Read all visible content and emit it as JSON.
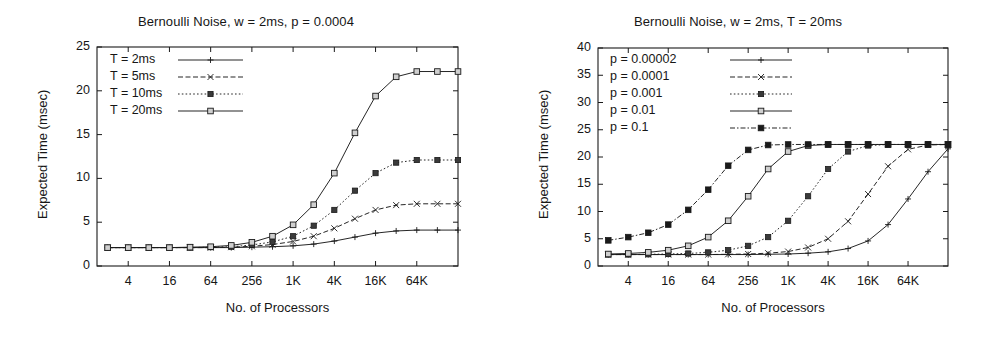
{
  "figure": {
    "panels": [
      {
        "id": "left-panel",
        "title": "Bernoulli Noise, w = 2ms, p = 0.0004",
        "xlabel": "No. of Processors",
        "ylabel": "Expected Time (msec)"
      },
      {
        "id": "right-panel",
        "title": "Bernoulli Noise, w = 2ms, T = 20ms",
        "xlabel": "No. of Processors",
        "ylabel": "Expected Time (msec)"
      }
    ]
  },
  "chart_data": [
    {
      "type": "line",
      "title": "Bernoulli Noise, w = 2ms, p = 0.0004",
      "xlabel": "No. of Processors",
      "ylabel": "Expected Time (msec)",
      "xscale": "log2",
      "x_tick_labels": [
        "4",
        "16",
        "64",
        "256",
        "1K",
        "4K",
        "16K",
        "64K"
      ],
      "x_tick_values": [
        4,
        16,
        64,
        256,
        1024,
        4096,
        16384,
        65536
      ],
      "xlim": [
        1.4,
        262144
      ],
      "ylim": [
        0,
        25
      ],
      "y_tick_labels": [
        "0",
        "5",
        "10",
        "15",
        "20",
        "25"
      ],
      "y_tick_values": [
        0,
        5,
        10,
        15,
        20,
        25
      ],
      "grid": false,
      "legend_position": "top-left",
      "x": [
        2,
        4,
        8,
        16,
        32,
        64,
        128,
        256,
        512,
        1024,
        2048,
        4096,
        8192,
        16384,
        32768,
        65536,
        131072,
        262144
      ],
      "series": [
        {
          "name": "T = 2ms",
          "marker": "plus",
          "dash": "solid",
          "values": [
            2.1,
            2.1,
            2.1,
            2.1,
            2.1,
            2.1,
            2.1,
            2.15,
            2.2,
            2.3,
            2.5,
            2.85,
            3.3,
            3.75,
            4.0,
            4.1,
            4.1,
            4.1
          ]
        },
        {
          "name": "T = 5ms",
          "marker": "cross",
          "dash": "dashed",
          "values": [
            2.1,
            2.1,
            2.1,
            2.1,
            2.1,
            2.1,
            2.15,
            2.25,
            2.45,
            2.8,
            3.4,
            4.3,
            5.4,
            6.4,
            6.95,
            7.1,
            7.1,
            7.1
          ]
        },
        {
          "name": "T = 10ms",
          "marker": "filled-square",
          "dash": "dotted",
          "values": [
            2.1,
            2.1,
            2.1,
            2.1,
            2.1,
            2.15,
            2.2,
            2.4,
            2.75,
            3.4,
            4.6,
            6.4,
            8.6,
            10.6,
            11.8,
            12.1,
            12.1,
            12.1
          ]
        },
        {
          "name": "T = 20ms",
          "marker": "open-square",
          "dash": "solid",
          "values": [
            2.1,
            2.1,
            2.1,
            2.1,
            2.15,
            2.2,
            2.35,
            2.7,
            3.4,
            4.7,
            7.0,
            10.6,
            15.2,
            19.4,
            21.6,
            22.2,
            22.2,
            22.2
          ]
        }
      ]
    },
    {
      "type": "line",
      "title": "Bernoulli Noise, w = 2ms, T = 20ms",
      "xlabel": "No. of Processors",
      "ylabel": "Expected Time (msec)",
      "xscale": "log2",
      "x_tick_labels": [
        "4",
        "16",
        "64",
        "256",
        "1K",
        "4K",
        "16K",
        "64K"
      ],
      "x_tick_values": [
        4,
        16,
        64,
        256,
        1024,
        4096,
        16384,
        65536
      ],
      "xlim": [
        1.4,
        262144
      ],
      "ylim": [
        0,
        40
      ],
      "y_tick_labels": [
        "0",
        "5",
        "10",
        "15",
        "20",
        "25",
        "30",
        "35",
        "40"
      ],
      "y_tick_values": [
        0,
        5,
        10,
        15,
        20,
        25,
        30,
        35,
        40
      ],
      "grid": false,
      "legend_position": "top-left",
      "x": [
        2,
        4,
        8,
        16,
        32,
        64,
        128,
        256,
        512,
        1024,
        2048,
        4096,
        8192,
        16384,
        32768,
        65536,
        131072,
        262144
      ],
      "series": [
        {
          "name": "p = 0.00002",
          "marker": "plus",
          "dash": "solid",
          "values": [
            2.1,
            2.1,
            2.1,
            2.1,
            2.1,
            2.1,
            2.1,
            2.1,
            2.15,
            2.2,
            2.35,
            2.6,
            3.2,
            4.6,
            7.6,
            12.3,
            17.3,
            21.5
          ]
        },
        {
          "name": "p = 0.0001",
          "marker": "cross",
          "dash": "dashed",
          "values": [
            2.1,
            2.1,
            2.1,
            2.1,
            2.1,
            2.1,
            2.15,
            2.2,
            2.35,
            2.65,
            3.4,
            5.0,
            8.2,
            13.2,
            18.3,
            21.4,
            22.2,
            22.3
          ]
        },
        {
          "name": "p = 0.001",
          "marker": "filled-square",
          "dash": "dotted",
          "values": [
            2.1,
            2.1,
            2.15,
            2.2,
            2.3,
            2.5,
            2.9,
            3.7,
            5.3,
            8.3,
            12.8,
            17.8,
            21.0,
            22.1,
            22.3,
            22.3,
            22.3,
            22.3
          ]
        },
        {
          "name": "p = 0.01",
          "marker": "open-square",
          "dash": "solid",
          "values": [
            2.2,
            2.3,
            2.5,
            2.9,
            3.7,
            5.3,
            8.3,
            12.8,
            17.8,
            21.0,
            22.1,
            22.3,
            22.3,
            22.3,
            22.3,
            22.3,
            22.3,
            22.3
          ]
        },
        {
          "name": "p = 0.1",
          "marker": "filled-square-solid",
          "dash": "dashdot",
          "values": [
            4.7,
            5.3,
            6.1,
            7.6,
            10.3,
            14.0,
            18.4,
            21.3,
            22.2,
            22.3,
            22.3,
            22.3,
            22.3,
            22.3,
            22.3,
            22.3,
            22.3,
            22.3
          ]
        }
      ]
    }
  ]
}
